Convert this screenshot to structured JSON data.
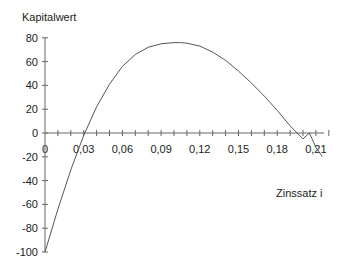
{
  "chart_data": {
    "type": "line",
    "title": "",
    "ylabel": "Kapitalwert",
    "xlabel": "Zinssatz i",
    "x_tick_labels": [
      "0",
      "0,03",
      "0,06",
      "0,09",
      "0,12",
      "0,15",
      "0,18",
      "0,21"
    ],
    "x_ticks": [
      0,
      0.03,
      0.06,
      0.09,
      0.12,
      0.15,
      0.18,
      0.21
    ],
    "x_minor_step": 0.01,
    "xlim": [
      0,
      0.22
    ],
    "y_tick_labels": [
      "80",
      "60",
      "40",
      "20",
      "0",
      "-20",
      "-40",
      "-60",
      "-80",
      "-100"
    ],
    "y_ticks": [
      80,
      60,
      40,
      20,
      0,
      -20,
      -40,
      -60,
      -80,
      -100
    ],
    "ylim": [
      -100,
      80
    ],
    "grid": false,
    "legend": null,
    "series": [
      {
        "name": "Kapitalwert",
        "x": [
          0,
          0.01,
          0.02,
          0.03,
          0.04,
          0.05,
          0.06,
          0.07,
          0.08,
          0.09,
          0.1,
          0.105,
          0.11,
          0.12,
          0.13,
          0.14,
          0.15,
          0.16,
          0.17,
          0.18,
          0.19,
          0.2,
          0.205,
          0.21,
          0.215
        ],
        "y": [
          -100,
          -64,
          -31,
          -2,
          22,
          41,
          56,
          66,
          72,
          75,
          76,
          76,
          75.5,
          73,
          68,
          61,
          52,
          42,
          31,
          19,
          6,
          -5,
          0,
          -12,
          -20
        ]
      }
    ]
  }
}
